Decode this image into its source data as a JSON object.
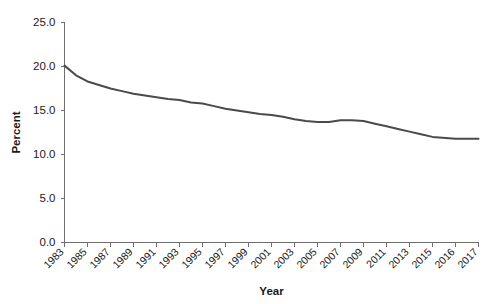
{
  "chart_data": {
    "type": "line",
    "title": "",
    "xlabel": "Year",
    "ylabel": "Percent",
    "grid": false,
    "legend": false,
    "xlim": [
      1983,
      2017
    ],
    "ylim": [
      0.0,
      25.0
    ],
    "ytick_labels": [
      "0.0",
      "5.0",
      "10.0",
      "15.0",
      "20.0",
      "25.0"
    ],
    "ytick_values": [
      0.0,
      5.0,
      10.0,
      15.0,
      20.0,
      25.0
    ],
    "xtick_labels": [
      "1983",
      "1985",
      "1987",
      "1989",
      "1991",
      "1993",
      "1995",
      "1997",
      "1999",
      "2001",
      "2003",
      "2005",
      "2007",
      "2009",
      "2011",
      "2013",
      "2015",
      "2016",
      "2017"
    ],
    "xtick_values": [
      1983,
      1985,
      1987,
      1989,
      1991,
      1993,
      1995,
      1997,
      1999,
      2001,
      2003,
      2005,
      2007,
      2009,
      2011,
      2013,
      2015,
      2016,
      2017
    ],
    "line_color": "#4a4a4a",
    "axis_color": "#6e6e6e",
    "x": [
      1983,
      1984,
      1985,
      1986,
      1987,
      1988,
      1989,
      1990,
      1991,
      1992,
      1993,
      1994,
      1995,
      1996,
      1997,
      1998,
      1999,
      2000,
      2001,
      2002,
      2003,
      2004,
      2005,
      2006,
      2007,
      2008,
      2009,
      2010,
      2011,
      2012,
      2013,
      2014,
      2015,
      2016,
      2017
    ],
    "values": [
      20.1,
      19.0,
      18.3,
      17.9,
      17.5,
      17.2,
      16.9,
      16.7,
      16.5,
      16.3,
      16.2,
      15.9,
      15.8,
      15.5,
      15.2,
      15.0,
      14.8,
      14.6,
      14.5,
      14.3,
      14.0,
      13.8,
      13.7,
      13.7,
      13.9,
      13.9,
      13.8,
      13.5,
      13.2,
      12.9,
      12.6,
      12.3,
      12.0,
      11.8,
      11.8
    ],
    "series": [
      {
        "name": "Percent",
        "values": [
          20.1,
          19.0,
          18.3,
          17.9,
          17.5,
          17.2,
          16.9,
          16.7,
          16.5,
          16.3,
          16.2,
          15.9,
          15.8,
          15.5,
          15.2,
          15.0,
          14.8,
          14.6,
          14.5,
          14.3,
          14.0,
          13.8,
          13.7,
          13.7,
          13.9,
          13.9,
          13.8,
          13.5,
          13.2,
          12.9,
          12.6,
          12.3,
          12.0,
          11.8,
          11.8
        ]
      }
    ]
  }
}
